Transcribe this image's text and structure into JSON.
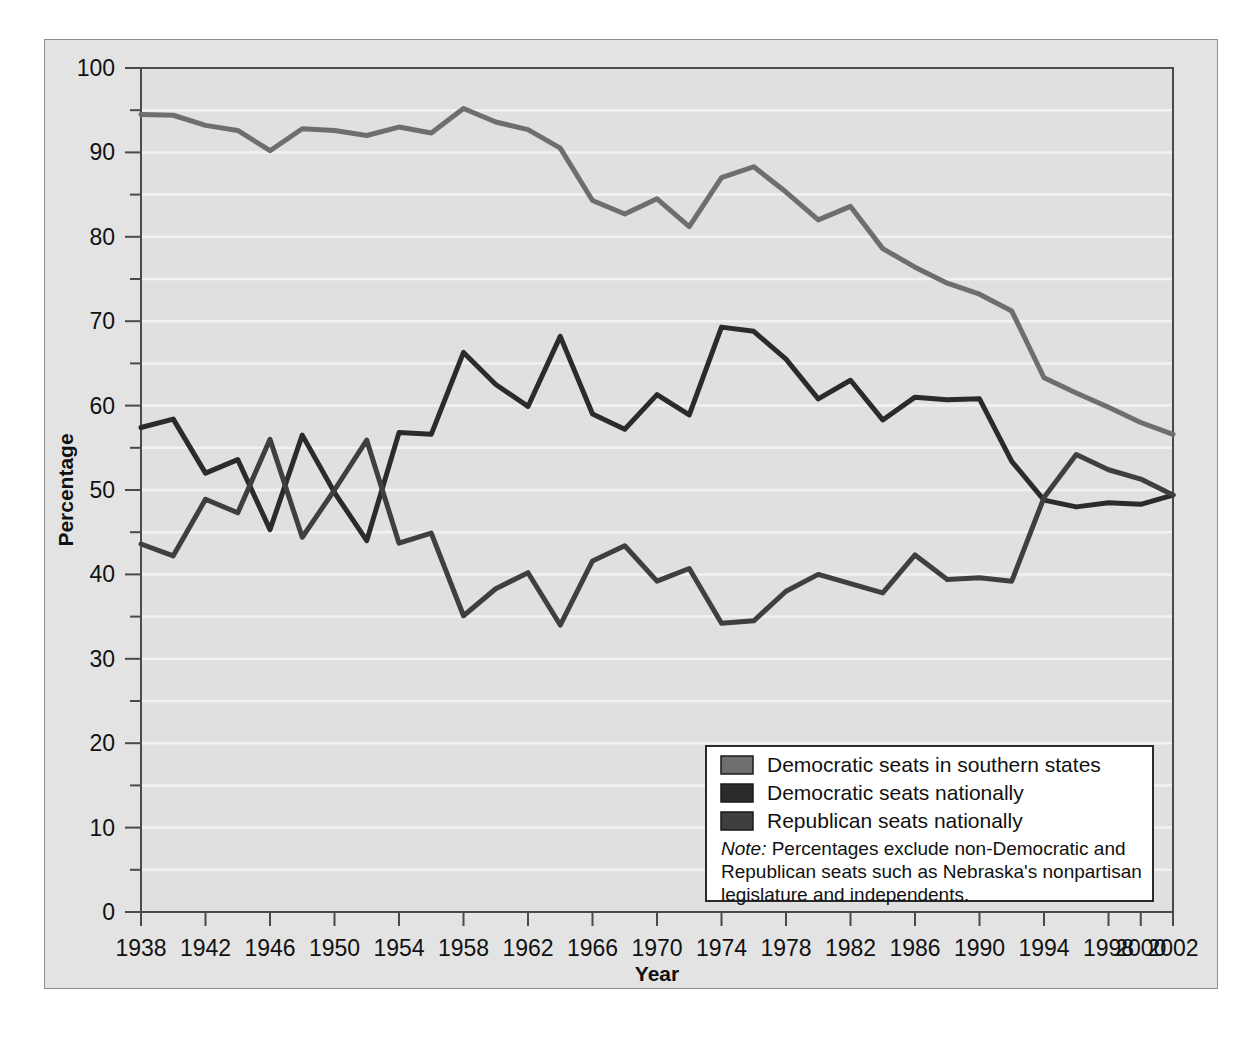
{
  "figure": {
    "background_color": "#ffffff",
    "panel_color": "#e3e3e3",
    "plot_bg_color": "#e0e0e0"
  },
  "chart_data": {
    "type": "line",
    "title": "",
    "xlabel": "Year",
    "ylabel": "Percentage",
    "xlim": [
      1938,
      2002
    ],
    "ylim": [
      0,
      100
    ],
    "grid": true,
    "grid_color": "#f2f2f2",
    "legend_position": "bottom-right",
    "y_ticks_major": [
      0,
      10,
      20,
      30,
      40,
      50,
      60,
      70,
      80,
      90,
      100
    ],
    "y_ticks_minor": [
      5,
      15,
      25,
      35,
      45,
      55,
      65,
      75,
      85,
      95
    ],
    "y_tick_labels": [
      "0",
      "10",
      "20",
      "30",
      "40",
      "50",
      "60",
      "70",
      "80",
      "90",
      "100"
    ],
    "x_tick_labels": [
      "1938",
      "1942",
      "1946",
      "1950",
      "1954",
      "1958",
      "1962",
      "1966",
      "1970",
      "1974",
      "1978",
      "1982",
      "1986",
      "1990",
      "1994",
      "1998",
      "2000",
      "2002"
    ],
    "x": [
      1938,
      1940,
      1942,
      1944,
      1946,
      1948,
      1950,
      1952,
      1954,
      1956,
      1958,
      1960,
      1962,
      1964,
      1966,
      1968,
      1970,
      1972,
      1974,
      1976,
      1978,
      1980,
      1982,
      1984,
      1986,
      1988,
      1990,
      1992,
      1994,
      1996,
      1998,
      2000,
      2002
    ],
    "series": [
      {
        "name": "Democratic seats in southern states",
        "color": "#6e6e6e",
        "values": [
          94.5,
          94.4,
          93.2,
          92.6,
          90.2,
          92.8,
          92.6,
          92.0,
          93.0,
          92.3,
          95.2,
          93.6,
          92.7,
          90.5,
          84.3,
          82.7,
          84.5,
          81.2,
          87.0,
          88.3,
          85.3,
          82.0,
          83.6,
          78.6,
          76.4,
          74.5,
          73.2,
          71.2,
          63.3,
          61.5,
          59.8,
          58.0,
          56.6
        ]
      },
      {
        "name": "Democratic seats nationally",
        "color": "#2b2b2b",
        "values": [
          57.4,
          58.4,
          52.0,
          53.6,
          45.3,
          56.5,
          49.7,
          44.0,
          56.8,
          56.6,
          66.3,
          62.5,
          59.9,
          68.2,
          59.0,
          57.2,
          61.3,
          58.9,
          69.3,
          68.8,
          65.5,
          60.8,
          63.0,
          58.3,
          61.0,
          60.7,
          60.8,
          53.4,
          48.8,
          48.0,
          48.5,
          48.3,
          49.4
        ]
      },
      {
        "name": "Republican seats nationally",
        "color": "#3f3f3f",
        "values": [
          43.6,
          42.2,
          48.9,
          47.3,
          56.0,
          44.4,
          50.0,
          55.9,
          43.7,
          44.9,
          35.1,
          38.3,
          40.2,
          34.0,
          41.6,
          43.4,
          39.2,
          40.7,
          34.2,
          34.5,
          38.0,
          40.0,
          38.9,
          37.8,
          42.3,
          39.4,
          39.6,
          39.2,
          49.1,
          54.2,
          52.4,
          51.3,
          49.4
        ]
      }
    ]
  },
  "legend": {
    "items": [
      {
        "label": "Democratic seats in southern states",
        "color": "#6e6e6e"
      },
      {
        "label": "Democratic seats nationally",
        "color": "#2b2b2b"
      },
      {
        "label": "Republican seats nationally",
        "color": "#3f3f3f"
      }
    ],
    "note_prefix": "Note:",
    "note_line1": " Percentages exclude non-Democratic and",
    "note_line2": "Republican seats such as Nebraska's nonpartisan",
    "note_line3": "legislature and independents."
  }
}
